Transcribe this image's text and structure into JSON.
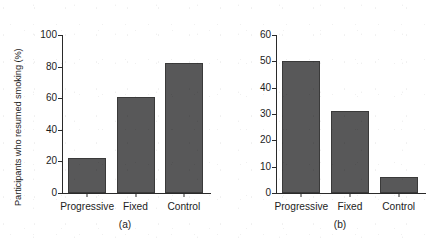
{
  "chart_data": [
    {
      "type": "bar",
      "panel": "a",
      "caption": "(a)",
      "title": "",
      "xlabel": "",
      "ylabel": "Participants who resumed smoking (%)",
      "categories": [
        "Progressive",
        "Fixed",
        "Control"
      ],
      "values": [
        22,
        61,
        82
      ],
      "ylim": [
        0,
        100
      ],
      "yticks": [
        0,
        20,
        40,
        60,
        80,
        100
      ],
      "grid": false,
      "legend": "none",
      "bar_color": "#585859",
      "bar_edge_color": "#3a3a3a"
    },
    {
      "type": "bar",
      "panel": "b",
      "caption": "(b)",
      "title": "",
      "xlabel": "",
      "ylabel": "Participants continuously abstinent (%)",
      "categories": [
        "Progressive",
        "Fixed",
        "Control"
      ],
      "values": [
        50,
        31,
        6
      ],
      "ylim": [
        0,
        60
      ],
      "yticks": [
        0,
        10,
        20,
        30,
        40,
        50,
        60
      ],
      "grid": false,
      "legend": "none",
      "bar_color": "#585859",
      "bar_edge_color": "#3a3a3a"
    }
  ],
  "figure": {
    "background": "#ffffff",
    "panel_a": {
      "ylabel": "Participants who resumed smoking (%)",
      "caption": "(a)",
      "yticks": [
        "0",
        "20",
        "40",
        "60",
        "80",
        "100"
      ],
      "categories": [
        "Progressive",
        "Fixed",
        "Control"
      ]
    },
    "panel_b": {
      "ylabel": "Participants continuously abstinent (%)",
      "caption": "(b)",
      "yticks": [
        "0",
        "10",
        "20",
        "30",
        "40",
        "50",
        "60"
      ],
      "categories": [
        "Progressive",
        "Fixed",
        "Control"
      ]
    }
  }
}
